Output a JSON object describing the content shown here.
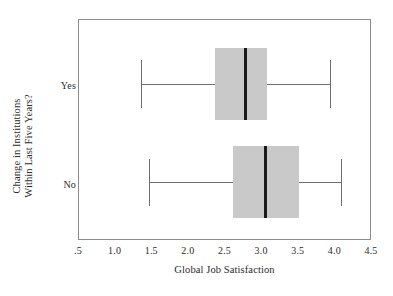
{
  "chart_data": {
    "type": "box",
    "title": "",
    "xlabel": "Global Job Satisfaction",
    "ylabel_lines": [
      "Change in Institutions",
      "Within Last Five Years?"
    ],
    "categories": [
      "Yes",
      "No"
    ],
    "xlim": [
      0.5,
      4.5
    ],
    "xticks": [
      0.5,
      1.0,
      1.5,
      2.0,
      2.5,
      3.0,
      3.5,
      4.0,
      4.5
    ],
    "xticklabels": [
      ".5",
      "1.0",
      "1.5",
      "2.0",
      "2.5",
      "3.0",
      "3.5",
      "4.0",
      "4.5"
    ],
    "grid": false,
    "legend": false,
    "orientation": "horizontal",
    "boxes": [
      {
        "category": "Yes",
        "whisker_low": 1.35,
        "q1": 2.35,
        "median": 2.77,
        "q3": 3.07,
        "whisker_high": 3.93
      },
      {
        "category": "No",
        "whisker_low": 1.45,
        "q1": 2.6,
        "median": 3.05,
        "q3": 3.5,
        "whisker_high": 4.07
      }
    ],
    "colors": {
      "box_fill": "#c9c9c9",
      "median": "#1a1a1a",
      "whisker": "#6e6e6e",
      "frame": "#8c8c8c",
      "background": "#ffffff",
      "text": "#2b2b2b"
    }
  }
}
